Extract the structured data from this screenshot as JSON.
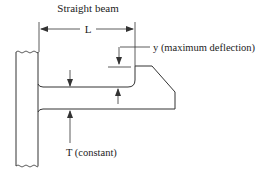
{
  "diagram": {
    "title": "Straight beam",
    "length_label": "L",
    "deflection_label": "y (maximum deflection)",
    "thickness_label": "T (constant)",
    "stroke_color": "#333333"
  }
}
